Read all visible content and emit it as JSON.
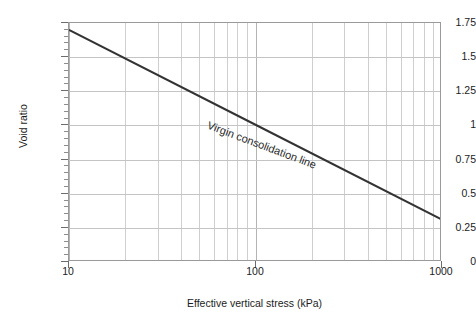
{
  "chart_data": {
    "type": "line",
    "title": "",
    "xlabel": "Effective vertical stress (kPa)",
    "ylabel": "Void ratio",
    "xscale": "log",
    "yscale": "linear",
    "xlim": [
      10,
      1000
    ],
    "ylim": [
      0,
      1.75
    ],
    "grid": true,
    "legend": "none",
    "x_ticks": [
      10,
      100,
      1000
    ],
    "x_tick_labels": [
      "10",
      "100",
      "1000"
    ],
    "x_minor_ticks": [
      20,
      30,
      40,
      50,
      60,
      70,
      80,
      90,
      200,
      300,
      400,
      500,
      600,
      700,
      800,
      900
    ],
    "y_ticks": [
      0,
      0.25,
      0.5,
      0.75,
      1,
      1.25,
      1.5,
      1.75
    ],
    "y_tick_labels": [
      "0",
      "0.25",
      "0.5",
      "0.75",
      "1",
      "1.25",
      "1.5",
      "1.75"
    ],
    "y_minor_step": 0.05,
    "series": [
      {
        "name": "Virgin consolidation line",
        "color": "#333333",
        "width": 2,
        "x": [
          10,
          100,
          1000
        ],
        "y": [
          1.7,
          1.005,
          0.31
        ]
      }
    ],
    "annotations": [
      {
        "text": "Virgin consolidation line",
        "rotation_deg": 20.5,
        "color": "#2a2a2a"
      }
    ],
    "compression_index_Cc": 0.695
  },
  "axes": {
    "y_title": "Void ratio",
    "x_title": "Effective vertical stress (kPa)",
    "y_labels": [
      "1.75",
      "1.5",
      "1.25",
      "1",
      "0.75",
      "0.5",
      "0.25",
      "0"
    ],
    "x_labels": [
      "10",
      "100",
      "1000"
    ]
  },
  "annotation": {
    "label": "Virgin consolidation line"
  },
  "colors": {
    "line": "#333333",
    "grid_major": "#b4b4b4",
    "grid_minor": "#cfcfcf",
    "frame": "#9a9a9a",
    "text": "#1c1c1c",
    "background": "#ffffff"
  }
}
